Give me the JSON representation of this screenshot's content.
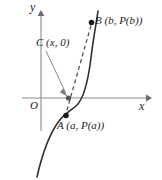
{
  "figure": {
    "kind": "coordinate-graph",
    "background_color": "#ffffff",
    "axes": {
      "x_axis_label": "x",
      "y_axis_label": "y",
      "origin_label": "O",
      "axis_color": "#8a8a8a",
      "x_axis_pixel_y": 98,
      "y_axis_pixel_x": 41,
      "x_axis_start_px": 22,
      "x_axis_end_px": 150,
      "y_axis_top_px": 12,
      "y_axis_bottom_px": 131
    },
    "curve": {
      "name": "P",
      "color": "#2f2f2f",
      "style": "solid",
      "path": "M 38 176 C 44 150 52 130 60 119 C 66 111 72 109 78 104 C 85 98 89 80 92 56 C 94 38 96 24 98 12"
    },
    "secant": {
      "name": "secant-AB",
      "color": "#555555",
      "style": "dashed",
      "from": "A",
      "to": "B",
      "dash_pattern": "4 3"
    },
    "points": [
      {
        "id": "A",
        "label": "A (a, P(a))",
        "px": 66,
        "py": 115,
        "marker": "filled-dot",
        "marker_color": "#1c1c1c",
        "on": "curve"
      },
      {
        "id": "C",
        "label": "C (x, 0)",
        "px": 69,
        "py": 98,
        "marker": "filled-dot",
        "marker_color": "#555555",
        "on": "x-axis"
      },
      {
        "id": "B",
        "label": "B (b, P(b))",
        "px": 91,
        "py": 23,
        "marker": "filled-dot",
        "marker_color": "#1c1c1c",
        "on": "curve"
      }
    ],
    "annotation_arrow": {
      "name": "c-label-pointer",
      "from_px": [
        46,
        50
      ],
      "to_px": [
        67,
        95
      ],
      "color": "#7a7a7a"
    }
  }
}
